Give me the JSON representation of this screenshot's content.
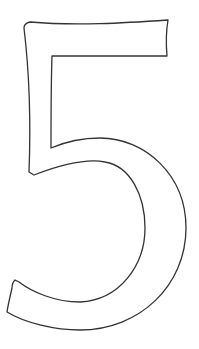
{
  "figure": {
    "glyph": "5",
    "stroke_color": "#333333",
    "fill_color": "#ffffff",
    "background": "#ffffff"
  }
}
